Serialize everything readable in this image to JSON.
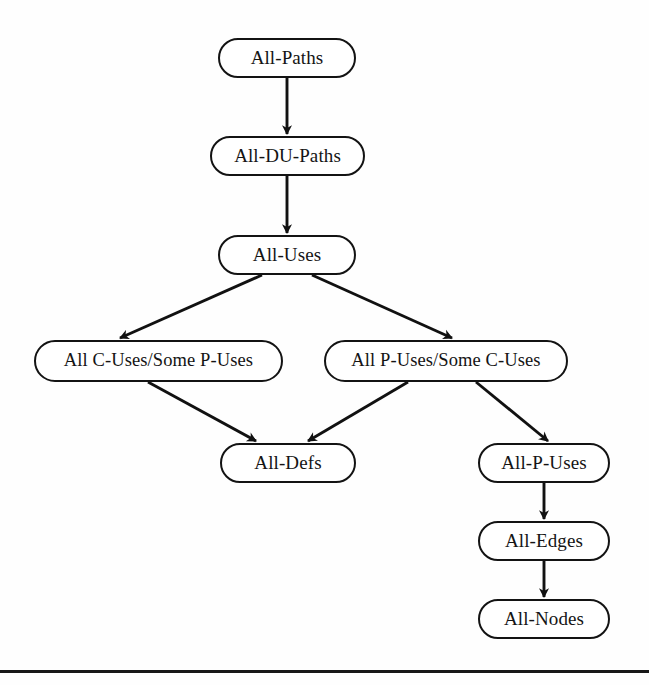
{
  "diagram": {
    "type": "directed-acyclic-graph",
    "colors": {
      "background": "#fefefe",
      "node_fill": "#ffffff",
      "node_border": "#131313",
      "text": "#141414",
      "edge": "#111111",
      "rule": "#171717"
    },
    "nodes": [
      {
        "id": "all-paths",
        "label": "All-Paths",
        "x": 218,
        "y": 38,
        "w": 138,
        "h": 40
      },
      {
        "id": "all-du-paths",
        "label": "All-DU-Paths",
        "x": 210,
        "y": 136,
        "w": 155,
        "h": 40
      },
      {
        "id": "all-uses",
        "label": "All-Uses",
        "x": 218,
        "y": 235,
        "w": 138,
        "h": 40
      },
      {
        "id": "all-c-uses-some-p-uses",
        "label": "All C-Uses/Some P-Uses",
        "x": 34,
        "y": 340,
        "w": 249,
        "h": 42
      },
      {
        "id": "all-p-uses-some-c-uses",
        "label": "All P-Uses/Some C-Uses",
        "x": 324,
        "y": 340,
        "w": 244,
        "h": 42
      },
      {
        "id": "all-defs",
        "label": "All-Defs",
        "x": 220,
        "y": 443,
        "w": 136,
        "h": 40
      },
      {
        "id": "all-p-uses",
        "label": "All-P-Uses",
        "x": 478,
        "y": 443,
        "w": 132,
        "h": 40
      },
      {
        "id": "all-edges",
        "label": "All-Edges",
        "x": 478,
        "y": 521,
        "w": 132,
        "h": 40
      },
      {
        "id": "all-nodes",
        "label": "All-Nodes",
        "x": 478,
        "y": 599,
        "w": 132,
        "h": 40
      }
    ],
    "edges": [
      {
        "from": "all-paths",
        "to": "all-du-paths",
        "x1": 287,
        "y1": 78,
        "x2": 287,
        "y2": 134
      },
      {
        "from": "all-du-paths",
        "to": "all-uses",
        "x1": 287,
        "y1": 176,
        "x2": 287,
        "y2": 233
      },
      {
        "from": "all-uses",
        "to": "all-c-uses-some-p-uses",
        "x1": 262,
        "y1": 275,
        "x2": 120,
        "y2": 338
      },
      {
        "from": "all-uses",
        "to": "all-p-uses-some-c-uses",
        "x1": 312,
        "y1": 275,
        "x2": 452,
        "y2": 338
      },
      {
        "from": "all-c-uses-some-p-uses",
        "to": "all-defs",
        "x1": 148,
        "y1": 382,
        "x2": 256,
        "y2": 441
      },
      {
        "from": "all-p-uses-some-c-uses",
        "to": "all-defs",
        "x1": 408,
        "y1": 382,
        "x2": 308,
        "y2": 441
      },
      {
        "from": "all-p-uses-some-c-uses",
        "to": "all-p-uses",
        "x1": 476,
        "y1": 382,
        "x2": 548,
        "y2": 441
      },
      {
        "from": "all-p-uses",
        "to": "all-edges",
        "x1": 544,
        "y1": 483,
        "x2": 544,
        "y2": 519
      },
      {
        "from": "all-edges",
        "to": "all-nodes",
        "x1": 544,
        "y1": 561,
        "x2": 544,
        "y2": 597
      }
    ],
    "rule": {
      "label": "page-footer-rule",
      "y": 670
    }
  }
}
